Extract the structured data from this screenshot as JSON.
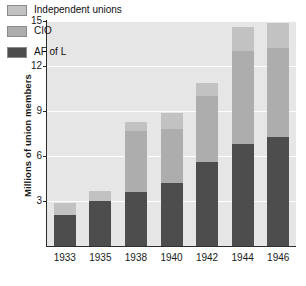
{
  "chart_data": {
    "type": "bar",
    "title": "",
    "subtitle": "",
    "xlabel": "",
    "ylabel": "Millions of union members",
    "categories": [
      "1933",
      "1935",
      "1938",
      "1940",
      "1942",
      "1944",
      "1946"
    ],
    "stacked": true,
    "series": [
      {
        "name": "AF of L",
        "color": "#4d4d4d",
        "values": [
          2.1,
          3.0,
          3.6,
          4.2,
          5.6,
          6.8,
          7.3
        ]
      },
      {
        "name": "CIO",
        "color": "#adadad",
        "values": [
          0.0,
          0.0,
          4.1,
          3.6,
          4.4,
          6.2,
          5.9
        ]
      },
      {
        "name": "Independent unions",
        "color": "#c2c2c2",
        "values": [
          0.8,
          0.7,
          0.6,
          1.1,
          0.9,
          1.6,
          1.7
        ]
      }
    ],
    "totals": [
      2.9,
      3.7,
      8.3,
      8.9,
      10.9,
      14.6,
      14.9
    ],
    "ylim": [
      0,
      15
    ],
    "yticks": [
      3,
      6,
      9,
      12,
      15
    ],
    "ytick_labels": [
      "3",
      "6",
      "9",
      "12",
      "15"
    ],
    "grid": true,
    "grid_axis": "y",
    "legend_position": "top-left",
    "plot_background": "#e6e6e6",
    "figure_background": "#ffffff",
    "axis_color": "#2b2b2b",
    "gridline_color": "#fdfdfd"
  },
  "legend": {
    "items": [
      {
        "label": "Independent unions",
        "color": "#c2c2c2"
      },
      {
        "label": "CIO",
        "color": "#adadad"
      },
      {
        "label": "AF of L",
        "color": "#4d4d4d"
      }
    ]
  },
  "axes": {
    "y_title": "Millions of union members",
    "y_ticks": [
      "15",
      "12",
      "9",
      "6",
      "3"
    ],
    "x_ticks": [
      "1933",
      "1935",
      "1938",
      "1940",
      "1942",
      "1944",
      "1946"
    ]
  }
}
